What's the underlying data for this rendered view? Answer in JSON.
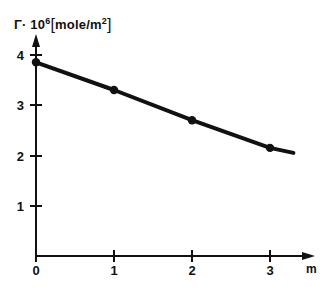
{
  "chart_data": {
    "type": "line",
    "title": "",
    "subtitle": "",
    "ylabel": "Γ· 10⁶ [mole/m²]",
    "ylabel_parts": {
      "symbol": "Γ· 10",
      "exponent": "6",
      "bracket_open": "[",
      "unit": "mole/m",
      "unit_exponent": "2",
      "bracket_close": "]"
    },
    "xlabel": "",
    "x_unit": "m",
    "x": [
      0,
      1,
      2,
      3
    ],
    "values": [
      3.85,
      3.3,
      2.7,
      2.15
    ],
    "series": [
      {
        "name": "Γ· 10⁶",
        "points": [
          {
            "x": 0,
            "y": 3.85
          },
          {
            "x": 1,
            "y": 3.3
          },
          {
            "x": 2,
            "y": 2.7
          },
          {
            "x": 3,
            "y": 2.15
          }
        ]
      }
    ],
    "line_extension": {
      "x": 3.3,
      "y": 2.05
    },
    "xlim": [
      0,
      3.5
    ],
    "ylim": [
      0,
      4.4
    ],
    "xticks": [
      0,
      1,
      2,
      3
    ],
    "xtick_labels": [
      "0",
      "1",
      "2",
      "3"
    ],
    "yticks": [
      1,
      2,
      3,
      4
    ],
    "ytick_labels": [
      "1",
      "2",
      "3",
      "4"
    ],
    "grid": false,
    "legend": false,
    "legend_position": "none",
    "marker": "filled-circle",
    "line_color": "#111111",
    "marker_color": "#111111",
    "axis_color": "#111111",
    "background_color": "#ffffff",
    "axis_arrows": true,
    "annotations": []
  }
}
